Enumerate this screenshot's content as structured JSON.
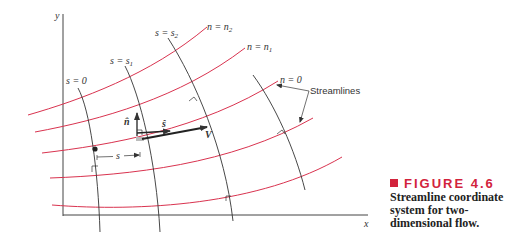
{
  "figure": {
    "number_label": "FIGURE 4.6",
    "caption_lines": [
      "Streamline coordinate",
      "system for two-",
      "dimensional flow."
    ],
    "accent_color": "#d2233c"
  },
  "diagram": {
    "axes": {
      "x_label": "x",
      "y_label": "y"
    },
    "streamline_labels": {
      "n2": "n = n",
      "n2_sub": "2",
      "n1": "n = n",
      "n1_sub": "1",
      "n0": "n = 0"
    },
    "normal_line_labels": {
      "s0": "s = 0",
      "s1": "s = s",
      "s1_sub": "1",
      "s2": "s = s",
      "s2_sub": "2"
    },
    "annotation": "Streamlines",
    "vectors": {
      "n_hat": "n̂",
      "s_hat": "ŝ",
      "V": "V"
    },
    "distance_label": "s",
    "colors": {
      "streamline": "#d9334f",
      "normal_line": "#333333",
      "axis": "#333333"
    }
  }
}
